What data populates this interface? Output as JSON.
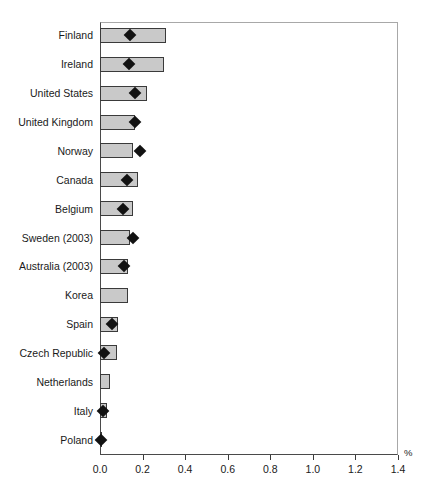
{
  "chart_data": {
    "type": "bar",
    "title": "",
    "subtitle": "",
    "xlabel": "%",
    "ylabel": "",
    "orientation": "horizontal",
    "xlim": [
      0.0,
      1.4
    ],
    "xticks": [
      "0.0",
      "0.2",
      "0.4",
      "0.6",
      "0.8",
      "1.0",
      "1.2",
      "1.4"
    ],
    "xtick_values": [
      0.0,
      0.2,
      0.4,
      0.6,
      0.8,
      1.0,
      1.2,
      1.4
    ],
    "grid": false,
    "legend_position": "none",
    "legend": [],
    "bar_color": "#c9c9c9",
    "bar_edge_color": "#3a3a3a",
    "marker_color": "#121212",
    "marker_shape": "diamond",
    "categories": [
      "Finland",
      "Ireland",
      "United States",
      "United Kingdom",
      "Norway",
      "Canada",
      "Belgium",
      "Sweden (2003)",
      "Australia (2003)",
      "Korea",
      "Spain",
      "Czech Republic",
      "Netherlands",
      "Italy",
      "Poland"
    ],
    "series": [
      {
        "name": "bar",
        "values": [
          0.31,
          0.3,
          0.22,
          0.165,
          0.155,
          0.18,
          0.155,
          0.14,
          0.13,
          0.13,
          0.085,
          0.08,
          0.045,
          0.035,
          0.01
        ]
      },
      {
        "name": "marker",
        "values": [
          0.14,
          0.135,
          0.165,
          0.165,
          0.19,
          0.125,
          0.11,
          0.155,
          0.115,
          null,
          0.055,
          0.02,
          null,
          0.015,
          0.005
        ]
      }
    ]
  }
}
